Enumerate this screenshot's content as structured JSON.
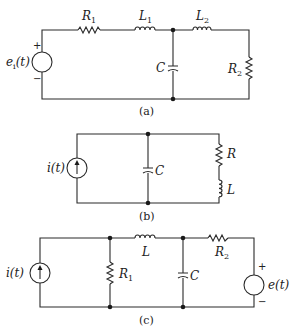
{
  "figure": {
    "circuits": [
      {
        "id": "a",
        "caption": "(a)",
        "source": {
          "type": "voltage",
          "label": "e",
          "subscript": "i",
          "arg": "(t)",
          "plus": "+",
          "minus": "−"
        },
        "components": {
          "R1": {
            "label": "R",
            "sub": "1"
          },
          "L1": {
            "label": "L",
            "sub": "1"
          },
          "C": {
            "label": "C"
          },
          "L2": {
            "label": "L",
            "sub": "2"
          },
          "R2": {
            "label": "R",
            "sub": "2"
          }
        }
      },
      {
        "id": "b",
        "caption": "(b)",
        "source": {
          "type": "current",
          "label": "i(t)"
        },
        "components": {
          "C": {
            "label": "C"
          },
          "R": {
            "label": "R"
          },
          "L": {
            "label": "L"
          }
        }
      },
      {
        "id": "c",
        "caption": "(c)",
        "source_left": {
          "type": "current",
          "label": "i(t)"
        },
        "source_right": {
          "type": "voltage",
          "label": "e(t)",
          "plus": "+",
          "minus": "−"
        },
        "components": {
          "R1": {
            "label": "R",
            "sub": "1"
          },
          "L": {
            "label": "L"
          },
          "C": {
            "label": "C"
          },
          "R2": {
            "label": "R",
            "sub": "2"
          }
        }
      }
    ]
  }
}
